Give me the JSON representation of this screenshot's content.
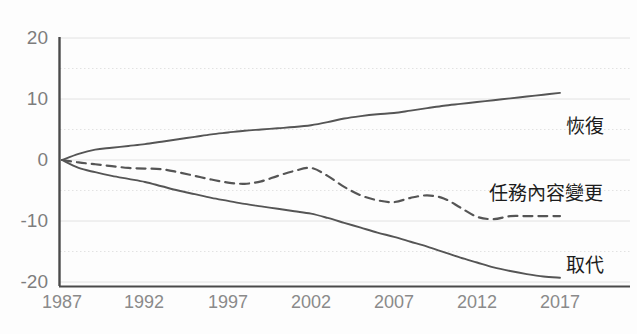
{
  "chart_data": {
    "type": "line",
    "title": "",
    "xlabel": "",
    "ylabel": "",
    "xlim": [
      1987,
      2017
    ],
    "ylim": [
      -20,
      20
    ],
    "grid": true,
    "legend_position": "right-inline",
    "y_ticks": [
      20,
      10,
      0,
      -10,
      -20
    ],
    "y_minor_gridlines": [
      15,
      5,
      -5,
      -15
    ],
    "x_ticks": [
      1987,
      1992,
      1997,
      2002,
      2007,
      2012,
      2017
    ],
    "x": [
      1987,
      1988,
      1989,
      1990,
      1991,
      1992,
      1993,
      1994,
      1995,
      1996,
      1997,
      1998,
      1999,
      2000,
      2001,
      2002,
      2003,
      2004,
      2005,
      2006,
      2007,
      2008,
      2009,
      2010,
      2011,
      2012,
      2013,
      2014,
      2015,
      2016,
      2017
    ],
    "series": [
      {
        "name": "恢復",
        "style": "solid",
        "color": "#555555",
        "label_value_year": 2017,
        "values": [
          0,
          1.0,
          1.7,
          2.0,
          2.3,
          2.6,
          3.0,
          3.4,
          3.8,
          4.2,
          4.5,
          4.8,
          5.0,
          5.2,
          5.4,
          5.7,
          6.2,
          6.8,
          7.2,
          7.5,
          7.7,
          8.1,
          8.5,
          8.9,
          9.2,
          9.5,
          9.8,
          10.1,
          10.4,
          10.7,
          11.0
        ]
      },
      {
        "name": "任務內容變更",
        "style": "dashed",
        "color": "#555555",
        "label_value_year": 2017,
        "values": [
          0,
          -0.4,
          -0.7,
          -1.0,
          -1.3,
          -1.4,
          -1.5,
          -2.0,
          -2.6,
          -3.2,
          -3.7,
          -3.9,
          -3.5,
          -2.6,
          -1.8,
          -1.3,
          -2.6,
          -4.4,
          -5.8,
          -6.6,
          -6.9,
          -6.2,
          -5.8,
          -6.3,
          -7.8,
          -9.3,
          -9.7,
          -9.2,
          -9.2,
          -9.2,
          -9.2
        ]
      },
      {
        "name": "取代",
        "style": "solid",
        "color": "#555555",
        "label_value_year": 2017,
        "values": [
          0,
          -1.3,
          -2.0,
          -2.6,
          -3.1,
          -3.6,
          -4.3,
          -5.0,
          -5.6,
          -6.2,
          -6.7,
          -7.2,
          -7.6,
          -8.0,
          -8.4,
          -8.8,
          -9.5,
          -10.3,
          -11.1,
          -11.9,
          -12.6,
          -13.4,
          -14.2,
          -15.1,
          -16.0,
          -16.8,
          -17.6,
          -18.2,
          -18.7,
          -19.1,
          -19.3
        ]
      }
    ]
  },
  "axis": {
    "y_tick_labels": [
      "20",
      "10",
      "0",
      "-10",
      "-20"
    ],
    "x_tick_labels": [
      "1987",
      "1992",
      "1997",
      "2002",
      "2007",
      "2012",
      "2017"
    ]
  },
  "labels": {
    "recovery": "恢復",
    "task_change": "任務內容變更",
    "replacement": "取代"
  },
  "colors": {
    "line": "#555555",
    "axis": "#4a4a4a",
    "gridline": "#e2e2e2",
    "tick_text": "#8a8a8a",
    "label_text": "#1c1c1c",
    "background": "#fdfdfd"
  }
}
